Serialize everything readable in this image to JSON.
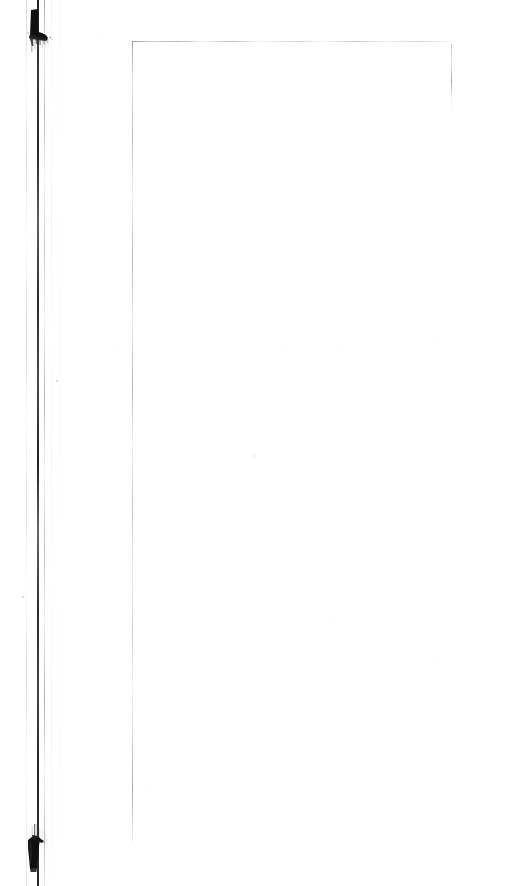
{
  "document": {
    "kind": "scanned-page",
    "title": "Scanned Document Page",
    "page_label": "",
    "visible_text": "",
    "body_text": "",
    "note": "blank scanned page",
    "width_px": 509,
    "height_px": 886,
    "background_color": "#ffffff"
  },
  "artifacts": {
    "ink_color": "#111111",
    "rule_color": "#9a9a9a",
    "streak_color": "#1a1a1a",
    "top_blot": {
      "name": "ink-blot-top",
      "x": 22,
      "y": 6,
      "width": 30,
      "height": 42
    },
    "bottom_blot": {
      "name": "ink-blot-bottom",
      "x": 20,
      "y": 824,
      "width": 28,
      "height": 46
    },
    "binding_streak": {
      "name": "binding-streak",
      "x": 37,
      "y": 0,
      "width": 2,
      "height": 886
    }
  },
  "frame": {
    "top_rule": {
      "x": 133,
      "y": 41,
      "length": 317,
      "orientation": "horizontal"
    },
    "left_rule": {
      "x": 132,
      "y": 41,
      "length": 805,
      "orientation": "vertical"
    },
    "right_rule": {
      "x": 451,
      "y": 44,
      "length": 68,
      "orientation": "vertical"
    }
  },
  "speckles": [
    {
      "x": 56,
      "y": 380,
      "size": 2
    },
    {
      "x": 22,
      "y": 596,
      "size": 2
    },
    {
      "x": 119,
      "y": 345,
      "size": 1
    },
    {
      "x": 253,
      "y": 455,
      "size": 2
    },
    {
      "x": 340,
      "y": 345,
      "size": 1
    },
    {
      "x": 433,
      "y": 660,
      "size": 1
    },
    {
      "x": 437,
      "y": 343,
      "size": 1
    },
    {
      "x": 150,
      "y": 785,
      "size": 1
    },
    {
      "x": 330,
      "y": 618,
      "size": 1
    },
    {
      "x": 282,
      "y": 347,
      "size": 1
    },
    {
      "x": 62,
      "y": 812,
      "size": 1
    },
    {
      "x": 98,
      "y": 33,
      "size": 1
    }
  ]
}
